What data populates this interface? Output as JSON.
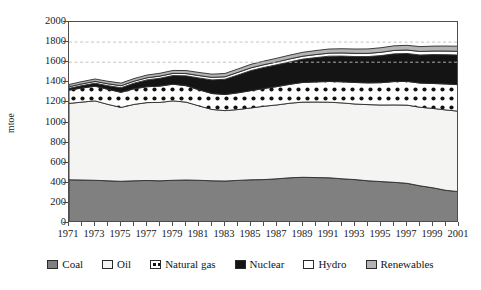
{
  "chart_data": {
    "type": "area",
    "title": "",
    "subtitle": "",
    "xlabel": "",
    "ylabel": "mtoe",
    "stacked": true,
    "grid": "dashed horizontal gridlines at 1600 and 1800 only",
    "gridline_values": [
      1600,
      1800
    ],
    "legend_position": "bottom",
    "xlim": [
      1971,
      2001
    ],
    "ylim": [
      0,
      2000
    ],
    "ytick_values": [
      0,
      200,
      400,
      600,
      800,
      1000,
      1200,
      1400,
      1600,
      1800,
      2000
    ],
    "ytick_labels": [
      "0",
      "200",
      "400",
      "600",
      "800",
      "1000",
      "1200",
      "1400",
      "1600",
      "1800",
      "2000"
    ],
    "xtick_labels": [
      "1971",
      "1973",
      "1975",
      "1977",
      "1979",
      "1981",
      "1983",
      "1985",
      "1987",
      "1989",
      "1991",
      "1993",
      "1995",
      "1997",
      "1999",
      "2001"
    ],
    "x": [
      1971,
      1972,
      1973,
      1974,
      1975,
      1976,
      1977,
      1978,
      1979,
      1980,
      1981,
      1982,
      1983,
      1984,
      1985,
      1986,
      1987,
      1988,
      1989,
      1990,
      1991,
      1992,
      1993,
      1994,
      1995,
      1996,
      1997,
      1998,
      1999,
      2000,
      2001
    ],
    "series": [
      {
        "name": "Coal",
        "color": "#808080",
        "pattern": "solid-gray",
        "values": [
          430,
          428,
          425,
          420,
          415,
          420,
          423,
          420,
          425,
          428,
          425,
          420,
          418,
          424,
          430,
          432,
          440,
          450,
          455,
          452,
          450,
          440,
          432,
          420,
          412,
          405,
          395,
          370,
          350,
          325,
          312
        ]
      },
      {
        "name": "Oil",
        "color": "#f4f4f2",
        "pattern": "solid-white",
        "values": [
          760,
          775,
          790,
          760,
          735,
          760,
          775,
          780,
          790,
          775,
          740,
          710,
          700,
          705,
          715,
          730,
          735,
          742,
          748,
          752,
          752,
          755,
          752,
          758,
          762,
          770,
          778,
          782,
          790,
          800,
          800
        ]
      },
      {
        "name": "Natural gas",
        "color": "#ffffff",
        "pattern": "dotted",
        "values": [
          132,
          140,
          146,
          150,
          150,
          155,
          158,
          162,
          166,
          163,
          160,
          158,
          160,
          166,
          172,
          176,
          182,
          188,
          196,
          200,
          206,
          210,
          214,
          216,
          222,
          232,
          236,
          240,
          248,
          258,
          264
        ]
      },
      {
        "name": "Nuclear",
        "color": "#141414",
        "pattern": "solid-black",
        "values": [
          18,
          24,
          30,
          36,
          46,
          56,
          68,
          78,
          86,
          98,
          118,
          136,
          152,
          178,
          200,
          210,
          218,
          224,
          232,
          242,
          252,
          256,
          258,
          262,
          270,
          276,
          278,
          280,
          288,
          292,
          296
        ]
      },
      {
        "name": "Hydro",
        "color": "#ffffff",
        "pattern": "solid-white",
        "values": [
          16,
          17,
          18,
          19,
          20,
          20,
          21,
          22,
          22,
          23,
          24,
          25,
          25,
          26,
          27,
          27,
          28,
          29,
          29,
          30,
          30,
          31,
          32,
          32,
          33,
          34,
          34,
          35,
          35,
          36,
          36
        ]
      },
      {
        "name": "Renewables",
        "color": "#b3b3b3",
        "pattern": "solid-lightgray",
        "values": [
          22,
          23,
          24,
          25,
          26,
          26,
          27,
          28,
          29,
          30,
          31,
          32,
          33,
          34,
          35,
          36,
          37,
          38,
          39,
          40,
          41,
          42,
          43,
          44,
          45,
          46,
          47,
          48,
          49,
          50,
          51
        ]
      }
    ]
  },
  "legend": {
    "items": [
      {
        "label": "Coal",
        "swatch": "coal-swatch"
      },
      {
        "label": "Oil",
        "swatch": "oil-swatch"
      },
      {
        "label": "Natural gas",
        "swatch": "natural-gas-swatch"
      },
      {
        "label": "Nuclear",
        "swatch": "nuclear-swatch"
      },
      {
        "label": "Hydro",
        "swatch": "hydro-swatch"
      },
      {
        "label": "Renewables",
        "swatch": "renewables-swatch"
      }
    ]
  },
  "colors": {
    "coal": "#808080",
    "oil": "#f4f4f2",
    "natural_gas": "#ffffff",
    "nuclear": "#141414",
    "hydro": "#ffffff",
    "renewables": "#b3b3b3",
    "axis": "#4d4d4d",
    "gridline": "#bdbdbd",
    "text": "#1a1a1a"
  }
}
